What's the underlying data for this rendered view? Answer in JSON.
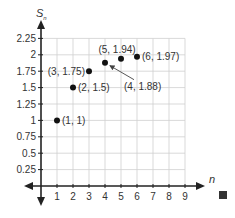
{
  "chart_data": {
    "type": "scatter",
    "title": "",
    "xlabel": "n",
    "ylabel": "S_n",
    "ylabel_main": "S",
    "ylabel_sub": "n",
    "xlim": [
      0,
      9
    ],
    "ylim": [
      0,
      2.25
    ],
    "grid": true,
    "legend": null,
    "x_ticks": [
      1,
      2,
      3,
      4,
      5,
      6,
      7,
      8,
      9
    ],
    "y_ticks": [
      0.25,
      0.5,
      0.75,
      1,
      1.25,
      1.5,
      1.75,
      2,
      2.25
    ],
    "x_tick_labels": [
      "1",
      "2",
      "3",
      "4",
      "5",
      "6",
      "7",
      "8",
      "9"
    ],
    "y_tick_labels": [
      "0.25",
      "0.5",
      "0.75",
      "1",
      "1.25",
      "1.5",
      "1.75",
      "2",
      "2.25"
    ],
    "series": [
      {
        "name": "S_n",
        "points": [
          {
            "x": 1,
            "y": 1,
            "label": "(1, 1)"
          },
          {
            "x": 2,
            "y": 1.5,
            "label": "(2, 1.5)"
          },
          {
            "x": 3,
            "y": 1.75,
            "label": "(3, 1.75)"
          },
          {
            "x": 4,
            "y": 1.88,
            "label": "(4, 1.88)"
          },
          {
            "x": 5,
            "y": 1.94,
            "label": "(5, 1.94)"
          },
          {
            "x": 6,
            "y": 1.97,
            "label": "(6, 1.97)"
          }
        ]
      }
    ],
    "annotations": [
      {
        "text": "(4, 1.88)",
        "type": "arrow-callout",
        "points_to": {
          "x": 4,
          "y": 1.88
        }
      }
    ],
    "end_marker": "filled-square"
  },
  "colors": {
    "point": "#111111",
    "axis": "#222222",
    "grid": "#cfcfcf",
    "text": "#333333"
  }
}
